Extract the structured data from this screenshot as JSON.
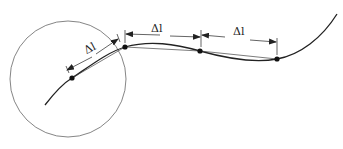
{
  "diagram": {
    "segment_label": "Δl",
    "labels": [
      {
        "text": "Δl",
        "x": 82,
        "y": 50
      },
      {
        "text": "Δl",
        "x": 155,
        "y": 37
      },
      {
        "text": "Δl",
        "x": 236,
        "y": 39
      }
    ],
    "circle": {
      "cx": 68,
      "cy": 79,
      "r": 58
    },
    "points": [
      {
        "x": 72,
        "y": 78
      },
      {
        "x": 125,
        "y": 47
      },
      {
        "x": 200,
        "y": 51
      },
      {
        "x": 277,
        "y": 59
      }
    ],
    "colors": {
      "stroke": "#222222",
      "circle": "#666666"
    }
  }
}
